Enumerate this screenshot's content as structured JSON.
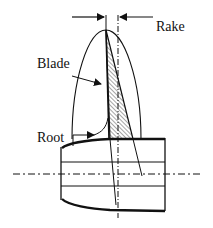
{
  "diagram": {
    "type": "propeller blade cross-section",
    "labels": {
      "rake": "Rake",
      "blade": "Blade",
      "root": "Root"
    },
    "colors": {
      "stroke": "#111111",
      "background": "#ffffff"
    }
  }
}
